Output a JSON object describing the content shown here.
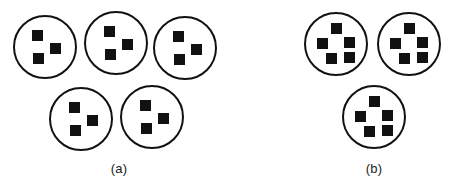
{
  "figure": {
    "width": 449,
    "height": 189,
    "background_color": "#ffffff",
    "stroke_color": "#111111",
    "fill_color": "#111111",
    "circle_stroke_width": 2,
    "circle_radius": 31,
    "square_size": 11
  },
  "panels": [
    {
      "id": "a",
      "caption": "(a)",
      "caption_x": 119,
      "caption_y": 161,
      "groups_count": 5,
      "items_per_group": 3,
      "circles": [
        {
          "cx": 45,
          "cy": 47,
          "squares": [
            {
              "x": 32,
              "y": 30
            },
            {
              "x": 50,
              "y": 43
            },
            {
              "x": 33,
              "y": 53
            }
          ]
        },
        {
          "cx": 116,
          "cy": 43,
          "squares": [
            {
              "x": 104,
              "y": 26
            },
            {
              "x": 122,
              "y": 39
            },
            {
              "x": 105,
              "y": 49
            }
          ]
        },
        {
          "cx": 185,
          "cy": 48,
          "squares": [
            {
              "x": 173,
              "y": 31
            },
            {
              "x": 191,
              "y": 44
            },
            {
              "x": 174,
              "y": 54
            }
          ]
        },
        {
          "cx": 81,
          "cy": 119,
          "squares": [
            {
              "x": 69,
              "y": 102
            },
            {
              "x": 87,
              "y": 115
            },
            {
              "x": 70,
              "y": 125
            }
          ]
        },
        {
          "cx": 152,
          "cy": 117,
          "squares": [
            {
              "x": 140,
              "y": 100
            },
            {
              "x": 158,
              "y": 113
            },
            {
              "x": 141,
              "y": 123
            }
          ]
        }
      ]
    },
    {
      "id": "b",
      "caption": "(b)",
      "caption_x": 374,
      "caption_y": 161,
      "groups_count": 3,
      "items_per_group": 5,
      "circles": [
        {
          "cx": 336,
          "cy": 44,
          "squares": [
            {
              "x": 331,
              "y": 23
            },
            {
              "x": 317,
              "y": 38
            },
            {
              "x": 344,
              "y": 37
            },
            {
              "x": 326,
              "y": 53
            },
            {
              "x": 344,
              "y": 52
            }
          ]
        },
        {
          "cx": 409,
          "cy": 44,
          "squares": [
            {
              "x": 404,
              "y": 23
            },
            {
              "x": 390,
              "y": 38
            },
            {
              "x": 417,
              "y": 37
            },
            {
              "x": 399,
              "y": 53
            },
            {
              "x": 417,
              "y": 52
            }
          ]
        },
        {
          "cx": 374,
          "cy": 117,
          "squares": [
            {
              "x": 369,
              "y": 96
            },
            {
              "x": 355,
              "y": 111
            },
            {
              "x": 382,
              "y": 110
            },
            {
              "x": 364,
              "y": 126
            },
            {
              "x": 382,
              "y": 125
            }
          ]
        }
      ]
    }
  ]
}
